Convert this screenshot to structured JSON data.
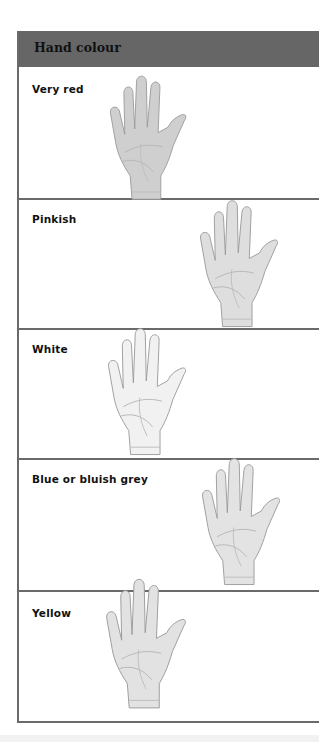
{
  "title": "Hand colour",
  "rows": [
    {
      "label": "Very red",
      "hand_icon": "hand-palm-icon",
      "shade": "#cfcfcf"
    },
    {
      "label": "Pinkish",
      "hand_icon": "hand-palm-icon",
      "shade": "#dedede"
    },
    {
      "label": "White",
      "hand_icon": "hand-palm-icon",
      "shade": "#f1f1f1"
    },
    {
      "label": "Blue or bluish grey",
      "hand_icon": "hand-palm-icon",
      "shade": "#e3e3e3"
    },
    {
      "label": "Yellow",
      "hand_icon": "hand-palm-icon",
      "shade": "#e2e2e2"
    }
  ],
  "colors": {
    "header_bg": "#666666",
    "rule": "#6a6a6a",
    "text": "#111111"
  }
}
